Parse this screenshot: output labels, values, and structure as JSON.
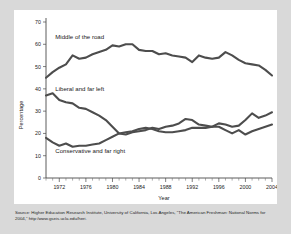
{
  "chart_data": {
    "type": "line",
    "title": "",
    "xlabel": "Year",
    "ylabel": "Percentage",
    "xlim": [
      1970,
      2004
    ],
    "ylim": [
      0,
      70
    ],
    "grid": false,
    "legend_position": "inline-annotations",
    "y_ticks": [
      0,
      10,
      20,
      30,
      40,
      50,
      60,
      70
    ],
    "x_ticks_labeled": [
      1972,
      1976,
      1980,
      1984,
      1988,
      1992,
      1996,
      2000,
      2004
    ],
    "x_ticks_minor_interval": 1,
    "x": [
      1970,
      1971,
      1972,
      1973,
      1974,
      1975,
      1976,
      1977,
      1978,
      1979,
      1980,
      1981,
      1982,
      1983,
      1984,
      1985,
      1986,
      1987,
      1988,
      1989,
      1990,
      1991,
      1992,
      1993,
      1994,
      1995,
      1996,
      1997,
      1998,
      1999,
      2000,
      2001,
      2002,
      2003,
      2004
    ],
    "series": [
      {
        "name": "Middle of the road",
        "label": "Middle of the road",
        "color": "#4d4d4d",
        "values": [
          45.0,
          47.5,
          49.5,
          51.0,
          55.0,
          53.5,
          54.0,
          55.5,
          56.5,
          57.5,
          59.5,
          59.0,
          60.0,
          60.0,
          57.5,
          57.0,
          57.0,
          55.5,
          56.0,
          55.0,
          54.5,
          54.0,
          52.0,
          55.0,
          54.0,
          53.5,
          54.0,
          56.5,
          55.0,
          53.0,
          51.5,
          51.0,
          50.5,
          48.5,
          46.0
        ]
      },
      {
        "name": "Liberal and far left",
        "label": "Liberal and far left",
        "color": "#4d4d4d",
        "values": [
          37.0,
          38.0,
          35.0,
          34.0,
          33.5,
          31.5,
          31.0,
          29.5,
          28.0,
          26.0,
          23.0,
          20.0,
          19.5,
          20.5,
          21.0,
          21.5,
          22.5,
          22.0,
          23.0,
          23.5,
          24.5,
          26.5,
          26.0,
          24.0,
          23.5,
          23.0,
          24.5,
          24.0,
          23.0,
          23.5,
          26.0,
          29.0,
          27.0,
          28.0,
          29.5
        ]
      },
      {
        "name": "Conservative and far right",
        "label": "Conservative and far right",
        "color": "#4d4d4d",
        "values": [
          18.0,
          16.0,
          14.5,
          15.5,
          14.0,
          14.5,
          14.5,
          15.0,
          15.5,
          17.0,
          18.5,
          20.0,
          20.5,
          21.0,
          22.0,
          22.5,
          22.0,
          21.0,
          20.5,
          20.5,
          21.0,
          21.5,
          22.5,
          22.5,
          22.5,
          23.0,
          23.0,
          21.5,
          20.0,
          21.5,
          19.5,
          21.0,
          22.0,
          23.0,
          24.0
        ]
      }
    ]
  },
  "source": {
    "line1": "Source: Higher Education Research Institute, University of California, Los Angeles, “The American Freshman: National Norms for",
    "line2": "2004,” http:/www.gseis.ucla.edu/heri."
  }
}
